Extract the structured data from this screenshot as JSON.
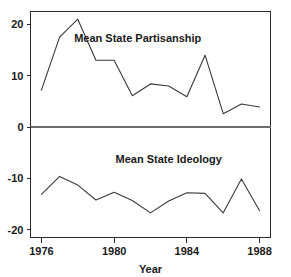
{
  "chart_data": {
    "type": "line",
    "title": "",
    "xlabel": "Year",
    "ylabel": "",
    "xlim": [
      1975.4,
      1988.6
    ],
    "ylim": [
      -21.5,
      22.5
    ],
    "grid": false,
    "legend": "inline-annotation",
    "zero_reference_line": 0,
    "x_ticks": [
      1976,
      1980,
      1984,
      1988
    ],
    "x_tick_labels": [
      "1976",
      "1980",
      "1984",
      "1988"
    ],
    "y_ticks": [
      20,
      10,
      0,
      -10,
      -20
    ],
    "y_tick_labels": [
      "20",
      "10",
      "0",
      "-10",
      "-20"
    ],
    "x": [
      1976,
      1977,
      1978,
      1979,
      1980,
      1981,
      1982,
      1983,
      1984,
      1985,
      1986,
      1987,
      1988
    ],
    "series": [
      {
        "name": "Mean State Partisanship",
        "values": [
          7.2,
          17.5,
          21.0,
          13.0,
          13.0,
          6.1,
          8.4,
          8.0,
          5.9,
          14.0,
          2.6,
          4.5,
          3.9
        ]
      },
      {
        "name": "Mean State Ideology",
        "values": [
          -13.1,
          -9.6,
          -11.3,
          -14.2,
          -12.7,
          -14.3,
          -16.7,
          -14.4,
          -12.8,
          -12.9,
          -16.7,
          -10.1,
          -16.3
        ]
      }
    ],
    "annotations": [
      {
        "text": "Mean State Partisanship",
        "x": 1981.3,
        "y": 16.5
      },
      {
        "text": "Mean State Ideology",
        "x": 1983.0,
        "y": -7.0
      }
    ],
    "colors": {
      "line": "#3a3a3a",
      "axis": "#2b2b2b",
      "zero_line": "#6e6e6e",
      "text": "#1a1a1a",
      "background": "#ffffff"
    }
  }
}
